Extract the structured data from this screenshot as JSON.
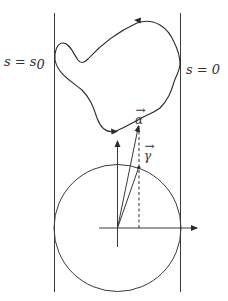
{
  "diagram": {
    "labels": {
      "left_boundary": "s = s",
      "left_boundary_sub": "0",
      "right_boundary": "s = 0",
      "vector_alpha": "α",
      "vector_gamma": "γ",
      "vector_arrow": "→"
    },
    "colors": {
      "stroke": "#2a2a2a",
      "background": "#ffffff"
    },
    "elements": {
      "vertical_lines": 2,
      "closed_curve_arrows": 2,
      "circle": 1,
      "axes": 2,
      "vectors": [
        "alpha",
        "gamma"
      ],
      "dashed_projection": 1
    }
  }
}
